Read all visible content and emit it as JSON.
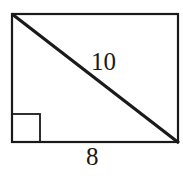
{
  "figure": {
    "type": "rectangle-with-diagonal",
    "labels": {
      "diagonal": "10",
      "bottom_side": "8"
    },
    "right_angle_marker": "bottom-left",
    "stroke_color": "#1a1a1a",
    "background": "#ffffff"
  }
}
